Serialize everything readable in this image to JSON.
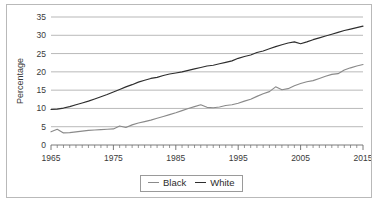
{
  "chart_data": {
    "type": "line",
    "title": "",
    "xlabel": "",
    "ylabel": "Percentage",
    "xlim": [
      1965,
      2015
    ],
    "ylim": [
      0,
      35
    ],
    "ytick_step": 5,
    "xtick_step": 10,
    "xminor_step": 1,
    "grid": true,
    "legend_position": "bottom-center",
    "ytick_labels": [
      "0",
      "5",
      "10",
      "15",
      "20",
      "25",
      "30",
      "35"
    ],
    "ytick_values": [
      0,
      5,
      10,
      15,
      20,
      25,
      30,
      35
    ],
    "xtick_labels": [
      "1965",
      "1975",
      "1985",
      "1995",
      "2005",
      "2015"
    ],
    "xtick_values": [
      1965,
      1975,
      1985,
      1995,
      2005,
      2015
    ],
    "x": [
      1965,
      1966,
      1967,
      1968,
      1969,
      1970,
      1971,
      1972,
      1973,
      1974,
      1975,
      1976,
      1977,
      1978,
      1979,
      1980,
      1981,
      1982,
      1983,
      1984,
      1985,
      1986,
      1987,
      1988,
      1989,
      1990,
      1991,
      1992,
      1993,
      1994,
      1995,
      1996,
      1997,
      1998,
      1999,
      2000,
      2001,
      2002,
      2003,
      2004,
      2005,
      2006,
      2007,
      2008,
      2009,
      2010,
      2011,
      2012,
      2013,
      2014,
      2015
    ],
    "series": [
      {
        "name": "Black",
        "color": "#8a8a8a",
        "values": [
          3.6,
          4.3,
          3.3,
          3.4,
          3.6,
          3.8,
          4.0,
          4.1,
          4.2,
          4.3,
          4.4,
          5.2,
          4.8,
          5.5,
          6.0,
          6.4,
          6.8,
          7.3,
          7.8,
          8.3,
          8.8,
          9.4,
          10.0,
          10.5,
          11.0,
          10.3,
          10.2,
          10.4,
          10.8,
          11.0,
          11.4,
          12.0,
          12.5,
          13.3,
          14.0,
          14.6,
          15.9,
          15.1,
          15.4,
          16.2,
          16.8,
          17.3,
          17.6,
          18.2,
          18.8,
          19.3,
          19.5,
          20.5,
          21.1,
          21.6,
          22.0
        ]
      },
      {
        "name": "White",
        "color": "#2e2e2e",
        "values": [
          9.7,
          9.8,
          10.1,
          10.5,
          11.0,
          11.5,
          12.0,
          12.6,
          13.2,
          13.8,
          14.5,
          15.2,
          15.9,
          16.5,
          17.2,
          17.7,
          18.2,
          18.5,
          19.0,
          19.4,
          19.7,
          20.0,
          20.4,
          20.8,
          21.2,
          21.6,
          21.8,
          22.2,
          22.6,
          23.0,
          23.7,
          24.2,
          24.6,
          25.3,
          25.7,
          26.3,
          26.9,
          27.4,
          27.9,
          28.2,
          27.7,
          28.2,
          28.8,
          29.3,
          29.8,
          30.3,
          30.8,
          31.3,
          31.7,
          32.1,
          32.5
        ]
      }
    ]
  },
  "legend": {
    "items": [
      {
        "label": "Black"
      },
      {
        "label": "White"
      }
    ]
  }
}
